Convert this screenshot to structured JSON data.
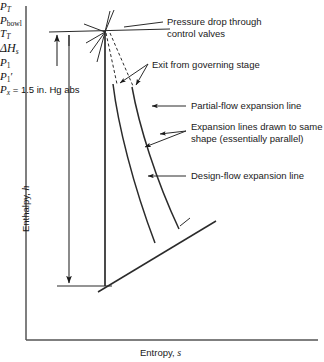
{
  "figure": {
    "type": "mollier-enthalpy-entropy-expansion-diagram",
    "axes": {
      "y_title_text": "Enthalpy, ",
      "y_title_symbol": "h",
      "x_title_text": "Entropy, ",
      "x_title_symbol": "s"
    },
    "symbols": {
      "p_t": "P",
      "p_t_sub": "T",
      "p_bowl": "P",
      "p_bowl_sub": "bowl",
      "t_t": "T",
      "t_t_sub": "T",
      "delta_hs": "ΔH",
      "delta_hs_sub": "s",
      "p_1": "P",
      "p_1_sub": "1",
      "p_1_prime": "P",
      "p_1_prime_sub": "1",
      "p_1_prime_mark": "′",
      "p_x": "P",
      "p_x_sub": "x",
      "p_x_value": " = 1.5 in. Hg abs"
    },
    "annotations": [
      {
        "id": "pressure-drop",
        "line1": "Pressure drop through",
        "line2": "control valves"
      },
      {
        "id": "exit-governing-stage",
        "line1": "Exit from governing stage",
        "line2": ""
      },
      {
        "id": "partial-flow",
        "line1": "Partial-flow expansion line",
        "line2": ""
      },
      {
        "id": "parallel-note",
        "line1": "Expansion lines drawn to same",
        "line2": "shape (essentially parallel)"
      },
      {
        "id": "design-flow",
        "line1": "Design-flow expansion line",
        "line2": ""
      }
    ],
    "colors": {
      "ink": "#1a1a1a",
      "axis": "#555555",
      "background": "#ffffff"
    }
  }
}
